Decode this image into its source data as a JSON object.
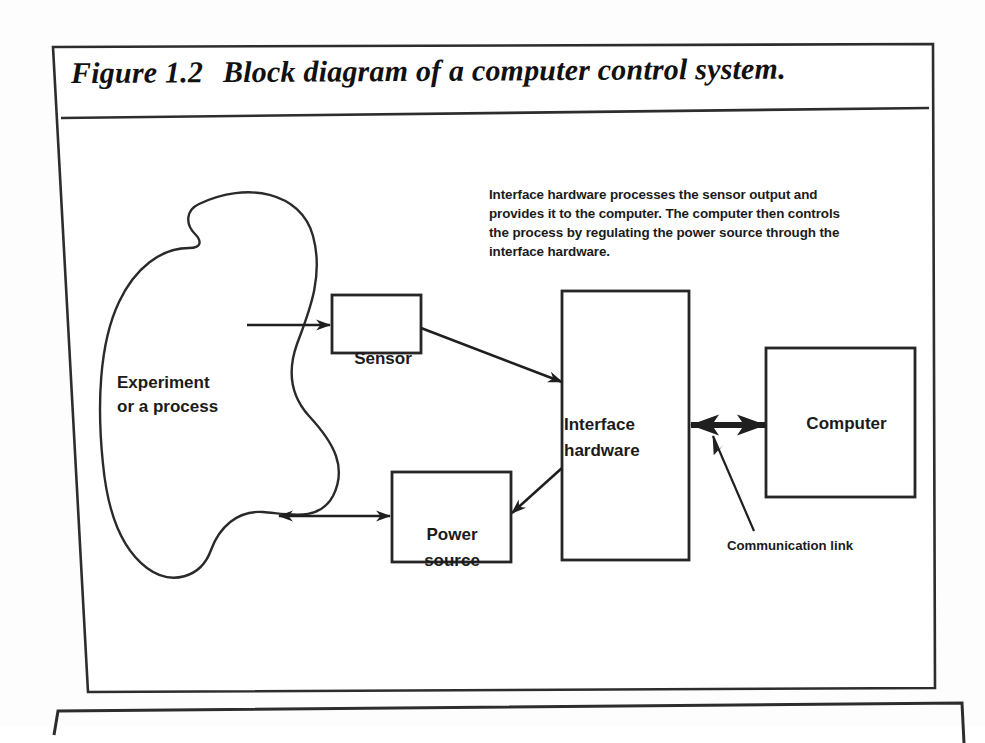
{
  "figure": {
    "number": "Figure 1.2",
    "title": "Block diagram of a computer control system.",
    "caption": "Interface hardware processes the sensor output and provides it to the computer. The computer then controls the process by regulating the power source through the interface hardware."
  },
  "nodes": {
    "process": "Experiment\nor a process",
    "sensor": "Sensor",
    "power_source": "Power\nsource",
    "interface_hardware": "Interface\nhardware",
    "computer": "Computer"
  },
  "annotations": {
    "communication_link": "Communication link"
  },
  "colors": {
    "ink": "#1b1b1b",
    "stroke": "#2a2a2a",
    "page_background": "#fdfdfd",
    "frame_background": "#ffffff"
  },
  "diagram_data": {
    "type": "block-diagram",
    "blocks": [
      {
        "id": "process",
        "label": "Experiment or a process",
        "shape": "amoeba"
      },
      {
        "id": "sensor",
        "label": "Sensor",
        "shape": "rectangle"
      },
      {
        "id": "power_source",
        "label": "Power source",
        "shape": "rectangle"
      },
      {
        "id": "interface_hardware",
        "label": "Interface hardware",
        "shape": "rectangle"
      },
      {
        "id": "computer",
        "label": "Computer",
        "shape": "rectangle"
      }
    ],
    "edges": [
      {
        "from": "process",
        "to": "sensor",
        "arrow": "single"
      },
      {
        "from": "sensor",
        "to": "interface_hardware",
        "arrow": "single"
      },
      {
        "from": "interface_hardware",
        "to": "power_source",
        "arrow": "single"
      },
      {
        "from": "power_source",
        "to": "process",
        "arrow": "double"
      },
      {
        "from": "interface_hardware",
        "to": "computer",
        "arrow": "double",
        "label": "Communication link"
      }
    ]
  }
}
